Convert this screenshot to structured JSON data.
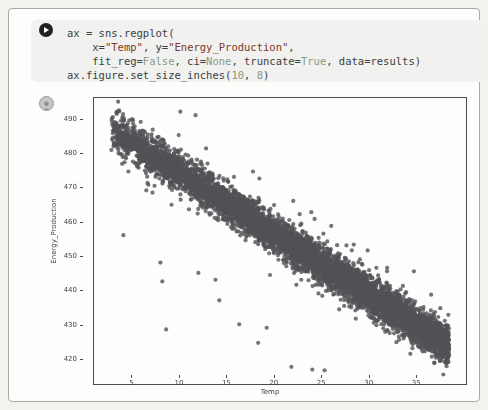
{
  "app": {
    "kind_label": "notebook code cell with plot output",
    "run_button_icon": "play-icon",
    "output_icon": "user-avatar-icon"
  },
  "code_cell": {
    "colors": {
      "plain": "#3c4043",
      "string": "#7d3a24",
      "keyword": "#8a9a86",
      "number": "#8a9a86"
    },
    "lines": [
      [
        {
          "t": "ax = sns.regplot(",
          "c": "plain"
        }
      ],
      [
        {
          "t": "    x=",
          "c": "plain"
        },
        {
          "t": "\"Temp\"",
          "c": "string"
        },
        {
          "t": ", y=",
          "c": "plain"
        },
        {
          "t": "\"Energy_Production\"",
          "c": "string"
        },
        {
          "t": ",",
          "c": "plain"
        }
      ],
      [
        {
          "t": "    fit_reg=",
          "c": "plain"
        },
        {
          "t": "False",
          "c": "keyword"
        },
        {
          "t": ", ci=",
          "c": "plain"
        },
        {
          "t": "None",
          "c": "keyword"
        },
        {
          "t": ", truncate=",
          "c": "plain"
        },
        {
          "t": "True",
          "c": "keyword"
        },
        {
          "t": ", data=results)",
          "c": "plain"
        }
      ],
      [
        {
          "t": "ax.figure.set_size_inches(",
          "c": "plain"
        },
        {
          "t": "10",
          "c": "number"
        },
        {
          "t": ", ",
          "c": "plain"
        },
        {
          "t": "8",
          "c": "number"
        },
        {
          "t": ")",
          "c": "plain"
        }
      ]
    ]
  },
  "chart_data": {
    "type": "scatter",
    "title": "",
    "xlabel": "Temp",
    "ylabel": "Energy_Production",
    "xlim": [
      0,
      39.2
    ],
    "ylim": [
      415.6,
      499.0
    ],
    "x_ticks": [
      5,
      10,
      15,
      20,
      25,
      30,
      35
    ],
    "y_ticks": [
      420,
      430,
      440,
      450,
      460,
      470,
      480,
      490
    ],
    "grid": false,
    "legend": null,
    "marker": {
      "color": "#515356",
      "alpha": 0.8,
      "radius": 2.1
    },
    "generator": {
      "model": "dense negative linear band: y = intercept + slope*x + N(0,sigma); x skewed toward high end",
      "seed": 42,
      "n_points": 7000,
      "x_min": 1.8,
      "x_max": 37.4,
      "x_skew": 0.78,
      "intercept": 493.0,
      "slope": -1.77,
      "sigma": 2.6
    },
    "halo": {
      "n_points": 260,
      "sigma": 5.5
    },
    "outliers": [
      [
        3.1,
        459.0
      ],
      [
        7.0,
        451.0
      ],
      [
        7.2,
        445.5
      ],
      [
        7.6,
        431.5
      ],
      [
        9.1,
        495.0
      ],
      [
        10.7,
        494.0
      ],
      [
        11.0,
        448.0
      ],
      [
        12.8,
        446.0
      ],
      [
        13.2,
        440.0
      ],
      [
        15.3,
        433.0
      ],
      [
        17.3,
        427.6
      ],
      [
        18.2,
        432.0
      ],
      [
        20.8,
        420.6
      ],
      [
        21.0,
        469.0
      ],
      [
        22.9,
        465.7
      ],
      [
        23.0,
        419.8
      ],
      [
        24.3,
        419.6
      ],
      [
        25.0,
        461.7
      ],
      [
        37.3,
        426.0
      ]
    ]
  }
}
